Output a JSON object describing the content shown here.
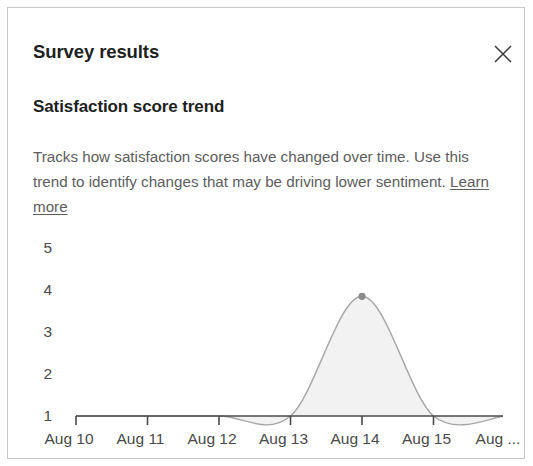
{
  "panel": {
    "title": "Survey results",
    "close_icon": "close-icon"
  },
  "section": {
    "heading": "Satisfaction score trend",
    "description_part1": "Tracks how satisfaction scores have changed over time. Use this trend to identify changes that may be driving lower sentiment. ",
    "learn_more_label": "Learn more"
  },
  "colors": {
    "title_text": "#201f1e",
    "body_text": "#5d5d5d",
    "axis_text": "#4a4a4a",
    "axis_line": "#4a4a4a",
    "series_stroke": "#a6a6a6",
    "series_fill": "#f2f2f2",
    "marker": "#8a8a8a",
    "panel_border": "#c8c8c8"
  },
  "chart_data": {
    "type": "area",
    "title": "Satisfaction score trend",
    "xlabel": "",
    "ylabel": "",
    "grid": false,
    "legend": null,
    "ylim": [
      1,
      5
    ],
    "yticks": [
      5,
      4,
      3,
      2,
      1
    ],
    "ytick_labels": [
      "5",
      "4",
      "3",
      "2",
      "1"
    ],
    "categories": [
      "Aug 10",
      "Aug 11",
      "Aug 12",
      "Aug 13",
      "Aug 14",
      "Aug 15",
      "Aug ..."
    ],
    "xtick_labels": [
      "Aug 10",
      "Aug 11",
      "Aug 12",
      "Aug 13",
      "Aug 14",
      "Aug 15",
      "Aug ..."
    ],
    "series": [
      {
        "name": "Satisfaction score",
        "values": [
          1,
          1,
          1,
          1,
          3.85,
          1,
          1
        ]
      }
    ],
    "markers": [
      {
        "x": "Aug 14",
        "y": 3.85
      }
    ],
    "annotations": []
  }
}
